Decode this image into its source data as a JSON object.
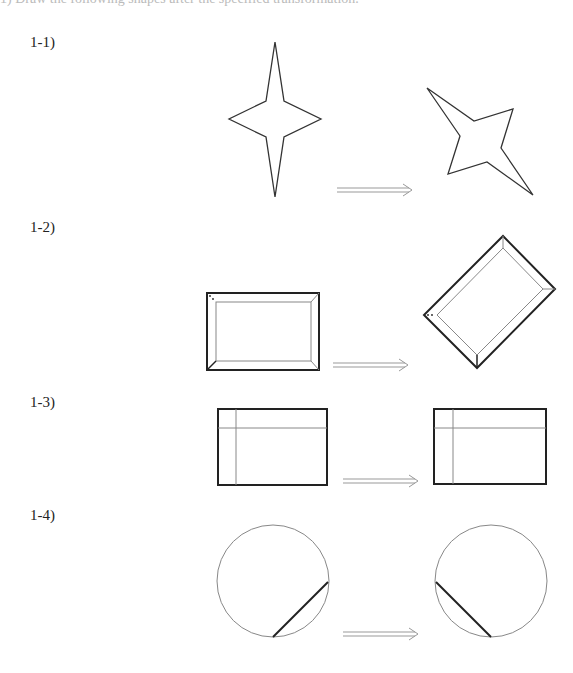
{
  "header": {
    "clipped_text": "1) Draw the following shapes after the specified transformation."
  },
  "sections": [
    {
      "label": "1-1)",
      "top": 34
    },
    {
      "label": "1-2)",
      "top": 219
    },
    {
      "label": "1-3)",
      "top": 394
    },
    {
      "label": "1-4)",
      "top": 507
    }
  ],
  "colors": {
    "stroke": "#333333",
    "thin": "#888888",
    "arrow": "#999999"
  }
}
